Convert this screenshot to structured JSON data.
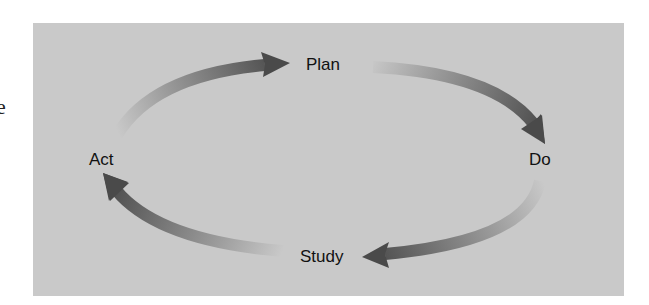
{
  "margin_fragment": "e",
  "diagram": {
    "title": "",
    "cycle": [
      "Plan",
      "Do",
      "Study",
      "Act"
    ],
    "nodes": {
      "plan": "Plan",
      "do": "Do",
      "study": "Study",
      "act": "Act"
    },
    "edges": [
      {
        "from": "Act",
        "to": "Plan"
      },
      {
        "from": "Plan",
        "to": "Do"
      },
      {
        "from": "Do",
        "to": "Study"
      },
      {
        "from": "Study",
        "to": "Act"
      }
    ],
    "colors": {
      "panel_background": "#c9c9c9",
      "arrow_dark": "#4a4a4a",
      "arrow_light": "#c9c9c9",
      "text": "#111111"
    }
  }
}
